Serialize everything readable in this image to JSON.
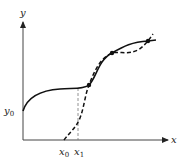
{
  "diagram": {
    "axes": {
      "x_label": "x",
      "y_label": "y",
      "color": "#333333"
    },
    "labels": {
      "y0": {
        "base": "y",
        "sub": "0"
      },
      "x0": {
        "base": "x",
        "sub": "0"
      },
      "x1": {
        "base": "x",
        "sub": "1"
      }
    },
    "curves": [
      {
        "name": "solution-curve",
        "style": "solid",
        "color": "#111111"
      },
      {
        "name": "approximation-curve",
        "style": "dashed",
        "color": "#111111"
      }
    ],
    "guides": [
      {
        "name": "x1-guide",
        "style": "dashed",
        "color": "#666666"
      }
    ],
    "intersection_points": 3
  }
}
